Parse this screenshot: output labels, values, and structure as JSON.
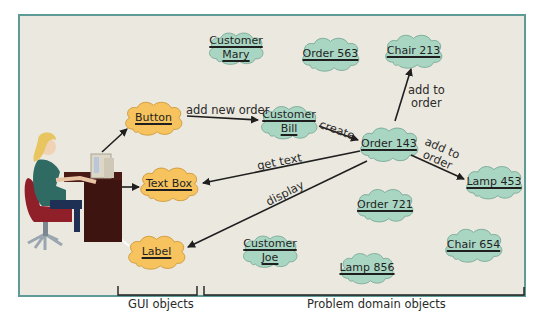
{
  "colors": {
    "frame_border": "#5e9a96",
    "background": "#ebe8df",
    "gui_object_fill": "#f6c35e",
    "gui_object_stroke": "#c98f2a",
    "domain_object_fill": "#a9d6c3",
    "domain_object_stroke": "#6a9f8c",
    "arrow": "#1f1f1f"
  },
  "gui_objects": [
    {
      "id": "button",
      "lines": [
        "Button"
      ]
    },
    {
      "id": "textbox",
      "lines": [
        "Text Box"
      ]
    },
    {
      "id": "label",
      "lines": [
        "Label"
      ]
    }
  ],
  "domain_objects": [
    {
      "id": "customer_mary",
      "lines": [
        "Customer",
        "Mary"
      ]
    },
    {
      "id": "order_563",
      "lines": [
        "Order 563"
      ]
    },
    {
      "id": "chair_213",
      "lines": [
        "Chair 213"
      ]
    },
    {
      "id": "customer_bill",
      "lines": [
        "Customer",
        "Bill"
      ]
    },
    {
      "id": "order_143",
      "lines": [
        "Order 143"
      ]
    },
    {
      "id": "lamp_453",
      "lines": [
        "Lamp 453"
      ]
    },
    {
      "id": "order_721",
      "lines": [
        "Order 721"
      ]
    },
    {
      "id": "customer_joe",
      "lines": [
        "Customer",
        "Joe"
      ]
    },
    {
      "id": "lamp_856",
      "lines": [
        "Lamp 856"
      ]
    },
    {
      "id": "chair_654",
      "lines": [
        "Chair 654"
      ]
    }
  ],
  "messages": [
    {
      "from": "user",
      "to": "button",
      "label": ""
    },
    {
      "from": "button",
      "to": "customer_bill",
      "label": "add new order"
    },
    {
      "from": "customer_bill",
      "to": "order_143",
      "label": "create"
    },
    {
      "from": "order_143",
      "to": "chair_213",
      "label": "add to order"
    },
    {
      "from": "order_143",
      "to": "lamp_453",
      "label": "add to order"
    },
    {
      "from": "order_143",
      "to": "textbox",
      "label": "get text"
    },
    {
      "from": "order_143",
      "to": "label",
      "label": "display"
    },
    {
      "from": "user",
      "to": "textbox",
      "label": ""
    },
    {
      "from": "label",
      "to": "user",
      "label": ""
    }
  ],
  "edge_labels": {
    "add_new_order": "add new order",
    "create": "create",
    "add_to_1": "add to",
    "order_1": "order",
    "add_to_2": "add to",
    "order_2": "order",
    "get_text": "get text",
    "display": "display"
  },
  "groups": {
    "gui": "GUI objects",
    "domain": "Problem domain objects"
  },
  "nodes": {
    "button": "Button",
    "textbox": "Text Box",
    "label": "Label",
    "customer_mary_1": "Customer",
    "customer_mary_2": "Mary",
    "order_563": "Order 563",
    "chair_213": "Chair 213",
    "customer_bill_1": "Customer",
    "customer_bill_2": "Bill",
    "order_143": "Order 143",
    "lamp_453": "Lamp 453",
    "order_721": "Order 721",
    "customer_joe_1": "Customer",
    "customer_joe_2": "Joe",
    "lamp_856": "Lamp 856",
    "chair_654": "Chair 654"
  }
}
